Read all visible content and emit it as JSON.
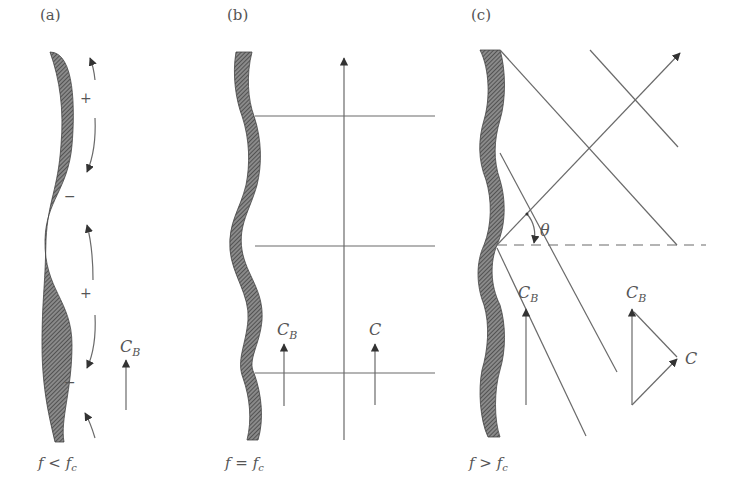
{
  "figure": {
    "panels": [
      {
        "id": "a",
        "label": "(a)",
        "condition": "f < f",
        "condition_sub": "c",
        "charges": [
          "+",
          "−",
          "+",
          "−"
        ],
        "vector_labels": [
          {
            "main": "C",
            "sub": "B"
          }
        ]
      },
      {
        "id": "b",
        "label": "(b)",
        "condition": "f = f",
        "condition_sub": "c",
        "vector_labels": [
          {
            "main": "C",
            "sub": "B"
          },
          {
            "main": "C",
            "sub": ""
          }
        ]
      },
      {
        "id": "c",
        "label": "(c)",
        "condition": "f > f",
        "condition_sub": "c",
        "angle_label": "θ",
        "vector_labels": [
          {
            "main": "C",
            "sub": "B"
          },
          {
            "main": "C",
            "sub": "B"
          },
          {
            "main": "C",
            "sub": ""
          }
        ]
      }
    ],
    "colors": {
      "line": "#6a6a6a",
      "wall": "#555555",
      "text": "#555555",
      "background": "#ffffff"
    }
  }
}
